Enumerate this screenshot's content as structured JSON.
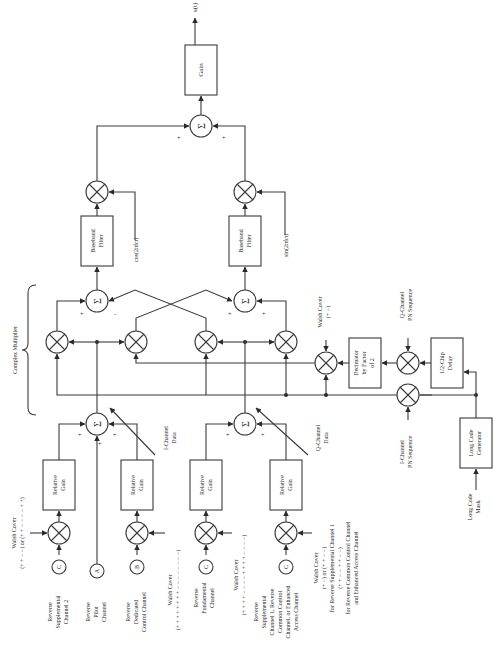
{
  "diagram": {
    "orientation": "rotated-90-ccw",
    "output": {
      "label": "s(t)"
    },
    "gain_block": {
      "label": "Gain"
    },
    "summers": {
      "symbol": "Σ",
      "output_sum_signs": [
        "+",
        "+"
      ],
      "i_branch_signs": [
        "+",
        "-"
      ],
      "q_branch_signs": [
        "+",
        "+"
      ],
      "i_data_signs": [
        "+",
        "+",
        "+"
      ],
      "q_data_signs": [
        "+",
        "+"
      ]
    },
    "carriers": {
      "cos": "cos(2πfct)",
      "sin": "sin(2πfct)"
    },
    "filters": {
      "i": [
        "Baseband",
        "Filter"
      ],
      "q": [
        "Baseband",
        "Filter"
      ]
    },
    "complex_multiplier": {
      "label": "Complex Multiplier"
    },
    "i_channel_data": [
      "I-Channel",
      "Data"
    ],
    "q_channel_data": [
      "Q-Channel",
      "Data"
    ],
    "walsh_cover_pn": {
      "lines": [
        "Walsh Cover",
        "(+ −)"
      ]
    },
    "decimator": {
      "lines": [
        "Decimator",
        "by Factor",
        "of 2"
      ]
    },
    "q_pn": {
      "lines": [
        "Q-Channel",
        "PN Sequence"
      ]
    },
    "i_pn": {
      "lines": [
        "I-Channel",
        "PN Sequence"
      ]
    },
    "chip_delay": {
      "lines": [
        "1/2-Chip",
        "Delay"
      ]
    },
    "long_code_generator": {
      "lines": [
        "Long Code",
        "Generator"
      ]
    },
    "long_code_mask": {
      "lines": [
        "Long Code",
        "Mask"
      ]
    },
    "relative_gain": [
      "Relative",
      "Gain"
    ],
    "channels": [
      {
        "id": "sup2",
        "node": "C",
        "lines": [
          "Reverse",
          "Supplemental",
          "Channel 2"
        ],
        "walsh": [
          "Walsh Cover",
          "(+ + − −) or (+ + − − − − + +)"
        ]
      },
      {
        "id": "pilot",
        "node": "A",
        "lines": [
          "Reverse",
          "Pilot",
          "Channel"
        ]
      },
      {
        "id": "dcch",
        "node": "B",
        "lines": [
          "Reverse",
          "Dedicated",
          "Control Channel"
        ],
        "walsh": [
          "Walsh Cover",
          "(+ + + + + + + + − − − − − − − −)"
        ]
      },
      {
        "id": "fch",
        "node": "C",
        "lines": [
          "Reverse",
          "Fundamental",
          "Channel"
        ],
        "walsh": [
          "Walsh Cover",
          "(+ + + + − − − − + + + + − − − −)"
        ]
      },
      {
        "id": "sup1",
        "node": "C",
        "lines": [
          "Reverse",
          "Supplemental",
          "Channel 1, Reverse",
          "Common Control",
          "Channel, or Enhanced",
          "Access Channel"
        ],
        "walsh": [
          "Walsh Cover",
          "(+ −) or (+ + − −)",
          "for Reverse Supplemental Channel 1",
          "(+ + − − + + − −)",
          "for Reverse Common Control Channel",
          "and Enhanced Access Channel"
        ]
      }
    ]
  }
}
